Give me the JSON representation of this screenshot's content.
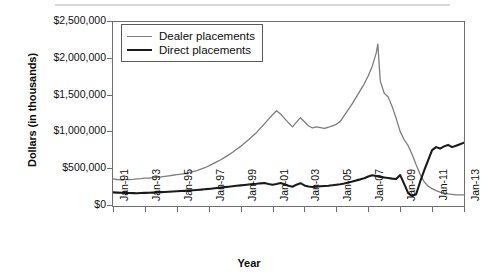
{
  "chart_data": {
    "type": "line",
    "title": "",
    "xlabel": "Year",
    "ylabel": "Dollars (in thousands)",
    "ylim": [
      0,
      2500000
    ],
    "yticks": [
      "$0",
      "$500,000",
      "$1,000,000",
      "$1,500,000",
      "$2,000,000",
      "$2,500,000"
    ],
    "ytick_values": [
      0,
      500000,
      1000000,
      1500000,
      2000000,
      2500000
    ],
    "xticks": [
      "Jan-91",
      "Jan-93",
      "Jan-95",
      "Jan-97",
      "Jan-99",
      "Jan-01",
      "Jan-03",
      "Jan-05",
      "Jan-07",
      "Jan-09",
      "Jan-11",
      "Jan-13"
    ],
    "xtick_values": [
      1991.0,
      1993.0,
      1995.0,
      1997.0,
      1999.0,
      2001.0,
      2003.0,
      2005.0,
      2007.0,
      2009.0,
      2011.0,
      2013.0
    ],
    "xlim": [
      1991.0,
      2013.0
    ],
    "grid": false,
    "legend_position": "upper-left-inside",
    "series": [
      {
        "name": "Dealer placements",
        "color": "#7d7d7d",
        "width": 1.3,
        "x": [
          1991.0,
          1991.25,
          1991.5,
          1991.75,
          1992.0,
          1992.25,
          1992.5,
          1992.75,
          1993.0,
          1993.25,
          1993.5,
          1993.75,
          1994.0,
          1994.25,
          1994.5,
          1994.75,
          1995.0,
          1995.25,
          1995.5,
          1995.75,
          1996.0,
          1996.25,
          1996.5,
          1996.75,
          1997.0,
          1997.25,
          1997.5,
          1997.75,
          1998.0,
          1998.25,
          1998.5,
          1998.75,
          1999.0,
          1999.25,
          1999.5,
          1999.75,
          2000.0,
          2000.25,
          2000.5,
          2000.75,
          2001.0,
          2001.25,
          2001.5,
          2001.75,
          2002.0,
          2002.25,
          2002.5,
          2002.75,
          2003.0,
          2003.25,
          2003.5,
          2003.75,
          2004.0,
          2004.25,
          2004.5,
          2004.75,
          2005.0,
          2005.25,
          2005.5,
          2005.75,
          2006.0,
          2006.25,
          2006.5,
          2006.75,
          2007.0,
          2007.25,
          2007.5,
          2007.6,
          2007.75,
          2008.0,
          2008.25,
          2008.5,
          2008.75,
          2009.0,
          2009.25,
          2009.5,
          2009.75,
          2010.0,
          2010.25,
          2010.5,
          2010.75,
          2011.0,
          2011.25,
          2011.5,
          2011.75,
          2012.0,
          2012.25,
          2012.5,
          2012.75,
          2013.0
        ],
        "y": [
          370000,
          360000,
          355000,
          360000,
          358000,
          362000,
          368000,
          372000,
          378000,
          380000,
          385000,
          390000,
          395000,
          402000,
          410000,
          418000,
          425000,
          432000,
          440000,
          452000,
          468000,
          482000,
          500000,
          520000,
          545000,
          572000,
          600000,
          628000,
          660000,
          695000,
          730000,
          770000,
          810000,
          855000,
          900000,
          950000,
          1000000,
          1060000,
          1120000,
          1180000,
          1240000,
          1295000,
          1250000,
          1190000,
          1130000,
          1075000,
          1140000,
          1200000,
          1145000,
          1090000,
          1060000,
          1075000,
          1065000,
          1055000,
          1070000,
          1090000,
          1110000,
          1150000,
          1230000,
          1310000,
          1390000,
          1480000,
          1570000,
          1660000,
          1770000,
          1900000,
          2080000,
          2200000,
          1700000,
          1530000,
          1480000,
          1350000,
          1190000,
          1010000,
          900000,
          820000,
          700000,
          560000,
          430000,
          330000,
          270000,
          235000,
          210000,
          190000,
          175000,
          165000,
          158000,
          152000,
          150000,
          150000
        ],
        "first_value": 370000,
        "peak_value": 2200000,
        "peak_x": "Jan-07 (mid-2007)",
        "last_value": 150000
      },
      {
        "name": "Direct placements",
        "color": "#1a1a1a",
        "width": 2.1,
        "x": [
          1991.0,
          1991.25,
          1991.5,
          1991.75,
          1992.0,
          1992.25,
          1992.5,
          1992.75,
          1993.0,
          1993.25,
          1993.5,
          1993.75,
          1994.0,
          1994.25,
          1994.5,
          1994.75,
          1995.0,
          1995.25,
          1995.5,
          1995.75,
          1996.0,
          1996.25,
          1996.5,
          1996.75,
          1997.0,
          1997.25,
          1997.5,
          1997.75,
          1998.0,
          1998.25,
          1998.5,
          1998.75,
          1999.0,
          1999.25,
          1999.5,
          1999.75,
          2000.0,
          2000.25,
          2000.5,
          2000.75,
          2001.0,
          2001.25,
          2001.5,
          2001.75,
          2002.0,
          2002.25,
          2002.5,
          2002.75,
          2003.0,
          2003.25,
          2003.5,
          2003.75,
          2004.0,
          2004.25,
          2004.5,
          2004.75,
          2005.0,
          2005.25,
          2005.5,
          2005.75,
          2006.0,
          2006.25,
          2006.5,
          2006.75,
          2007.0,
          2007.25,
          2007.5,
          2007.75,
          2008.0,
          2008.25,
          2008.5,
          2008.75,
          2009.0,
          2009.25,
          2009.5,
          2009.75,
          2010.0,
          2010.25,
          2010.5,
          2010.75,
          2011.0,
          2011.25,
          2011.5,
          2011.75,
          2012.0,
          2012.25,
          2012.5,
          2012.75,
          2013.0
        ],
        "y": [
          185000,
          182000,
          180000,
          178000,
          176000,
          175000,
          174000,
          176000,
          178000,
          180000,
          182000,
          185000,
          188000,
          190000,
          193000,
          196000,
          200000,
          203000,
          206000,
          210000,
          214000,
          218000,
          222000,
          228000,
          232000,
          238000,
          244000,
          250000,
          256000,
          262000,
          268000,
          274000,
          280000,
          286000,
          292000,
          298000,
          302000,
          308000,
          312000,
          300000,
          290000,
          300000,
          312000,
          296000,
          275000,
          262000,
          290000,
          310000,
          280000,
          265000,
          258000,
          262000,
          268000,
          272000,
          276000,
          282000,
          288000,
          295000,
          305000,
          318000,
          332000,
          348000,
          362000,
          378000,
          400000,
          418000,
          408000,
          396000,
          388000,
          380000,
          372000,
          366000,
          420000,
          300000,
          175000,
          135000,
          160000,
          330000,
          480000,
          620000,
          760000,
          800000,
          780000,
          810000,
          830000,
          800000,
          820000,
          840000,
          860000
        ],
        "first_value": 185000,
        "peak_value": 860000,
        "last_value": 860000,
        "crossover_x": "mid-2010"
      }
    ]
  },
  "legend": {
    "items": [
      {
        "label": "Dealer placements",
        "color": "#7d7d7d"
      },
      {
        "label": "Direct placements",
        "color": "#1a1a1a"
      }
    ]
  },
  "axes": {
    "y_title": "Dollars (in thousands)",
    "x_title": "Year"
  }
}
